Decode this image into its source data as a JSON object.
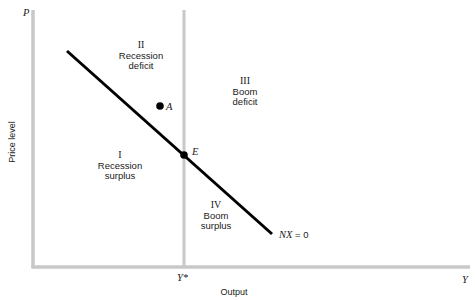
{
  "diagram": {
    "axes": {
      "y_axis_symbol": "P",
      "x_axis_symbol": "Y",
      "y_axis_title": "Price level",
      "x_axis_title": "Output",
      "x_marker_label": "Y*",
      "axis_color": "#c8c8c8"
    },
    "curve": {
      "label_italic": "NX",
      "label_rest": " = 0",
      "color": "#000000"
    },
    "points": {
      "A": "A",
      "E": "E"
    },
    "regions": [
      {
        "numeral": "I",
        "line1": "Recession",
        "line2": "surplus"
      },
      {
        "numeral": "II",
        "line1": "Recession",
        "line2": "deficit"
      },
      {
        "numeral": "III",
        "line1": "Boom",
        "line2": "deficit"
      },
      {
        "numeral": "IV",
        "line1": "Boom",
        "line2": "surplus"
      }
    ]
  }
}
